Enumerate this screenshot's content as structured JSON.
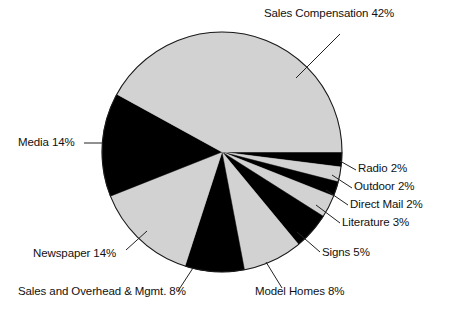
{
  "chart_data": {
    "type": "pie",
    "title": "",
    "subtitle": "",
    "xlabel": "",
    "ylabel": "",
    "legend_position": "none",
    "grid": false,
    "start_angle_deg": 0,
    "direction": "clockwise",
    "units": "percent",
    "total": 100,
    "categories": [
      "Radio",
      "Outdoor",
      "Direct Mail",
      "Literature",
      "Signs",
      "Model Homes",
      "Sales and Overhead & Mgmt.",
      "Newspaper",
      "Media",
      "Sales Compensation"
    ],
    "values": [
      2,
      2,
      2,
      3,
      5,
      8,
      8,
      14,
      14,
      42
    ],
    "slices": [
      {
        "name": "radio",
        "label": "Radio 2%",
        "category": "Radio",
        "value": 2,
        "fill": "#000000",
        "start_deg": 0,
        "end_deg": 7.2
      },
      {
        "name": "outdoor",
        "label": "Outdoor 2%",
        "category": "Outdoor",
        "value": 2,
        "fill": "#d2d2d2",
        "start_deg": 7.2,
        "end_deg": 14.4
      },
      {
        "name": "direct-mail",
        "label": "Direct Mail 2%",
        "category": "Direct Mail",
        "value": 2,
        "fill": "#000000",
        "start_deg": 14.4,
        "end_deg": 21.6
      },
      {
        "name": "literature",
        "label": "Literature 3%",
        "category": "Literature",
        "value": 3,
        "fill": "#d2d2d2",
        "start_deg": 21.6,
        "end_deg": 32.4
      },
      {
        "name": "signs",
        "label": "Signs 5%",
        "category": "Signs",
        "value": 5,
        "fill": "#000000",
        "start_deg": 32.4,
        "end_deg": 50.4
      },
      {
        "name": "model-homes",
        "label": "Model Homes 8%",
        "category": "Model Homes",
        "value": 8,
        "fill": "#d2d2d2",
        "start_deg": 50.4,
        "end_deg": 79.2
      },
      {
        "name": "sales-and-overhead-mgmt",
        "label": "Sales and Overhead & Mgmt. 8%",
        "category": "Sales and Overhead & Mgmt.",
        "value": 8,
        "fill": "#000000",
        "start_deg": 79.2,
        "end_deg": 108.0
      },
      {
        "name": "newspaper",
        "label": "Newspaper 14%",
        "category": "Newspaper",
        "value": 14,
        "fill": "#d2d2d2",
        "start_deg": 108.0,
        "end_deg": 158.4
      },
      {
        "name": "media",
        "label": "Media 14%",
        "category": "Media",
        "value": 14,
        "fill": "#000000",
        "start_deg": 158.4,
        "end_deg": 208.8
      },
      {
        "name": "sales-compensation",
        "label": "Sales Compensation 42%",
        "category": "Sales Compensation",
        "value": 42,
        "fill": "#d2d2d2",
        "start_deg": 208.8,
        "end_deg": 360.0
      }
    ],
    "geometry": {
      "center_x": 222,
      "center_y": 152,
      "radius": 120
    },
    "colors": {
      "light_slice": "#d2d2d2",
      "dark_slice": "#000000",
      "outline": "#1a1a1a",
      "leader_line": "#222222",
      "text": "#111111",
      "background": "#ffffff"
    }
  },
  "labels": {
    "sales_compensation": "Sales Compensation 42%",
    "radio": "Radio 2%",
    "outdoor": "Outdoor 2%",
    "direct_mail": "Direct Mail 2%",
    "literature": "Literature 3%",
    "signs": "Signs 5%",
    "model_homes": "Model Homes 8%",
    "sales_and_overhead": "Sales and Overhead & Mgmt. 8%",
    "newspaper": "Newspaper 14%",
    "media": "Media 14%"
  }
}
